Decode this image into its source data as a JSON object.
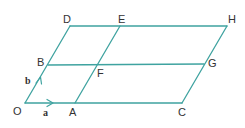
{
  "diagram": {
    "type": "parallelogram-grid",
    "line_color": "#3fa3a0",
    "text_color": "#333333",
    "points": {
      "O": {
        "label": "O",
        "x": 25,
        "y": 103
      },
      "A": {
        "label": "A",
        "x": 75,
        "y": 103
      },
      "C": {
        "label": "C",
        "x": 182,
        "y": 103
      },
      "B": {
        "label": "B",
        "x": 48,
        "y": 65
      },
      "F": {
        "label": "F",
        "x": 97,
        "y": 65
      },
      "G": {
        "label": "G",
        "x": 204,
        "y": 64
      },
      "D": {
        "label": "D",
        "x": 70,
        "y": 26
      },
      "E": {
        "label": "E",
        "x": 120,
        "y": 26
      },
      "H": {
        "label": "H",
        "x": 227,
        "y": 26
      }
    },
    "vectors": {
      "a": {
        "label": "a",
        "from": "O",
        "to": "A"
      },
      "b": {
        "label": "b",
        "from": "O",
        "to": "B"
      }
    },
    "segments": [
      [
        "O",
        "C"
      ],
      [
        "B",
        "G"
      ],
      [
        "D",
        "H"
      ],
      [
        "O",
        "D"
      ],
      [
        "A",
        "E"
      ],
      [
        "C",
        "H"
      ]
    ]
  }
}
